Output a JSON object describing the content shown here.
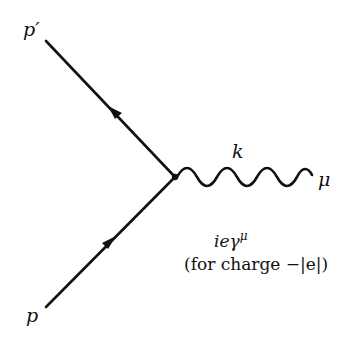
{
  "diagram": {
    "type": "feynman-vertex",
    "labels": {
      "outgoing_fermion": "p′",
      "incoming_fermion": "p",
      "photon_momentum": "k",
      "photon_index": "μ"
    },
    "vertex_factor": "ieγ",
    "vertex_factor_superscript": "μ",
    "note": "(for charge −|e|)",
    "colors": {
      "line": "#111111",
      "background": "#ffffff"
    }
  }
}
